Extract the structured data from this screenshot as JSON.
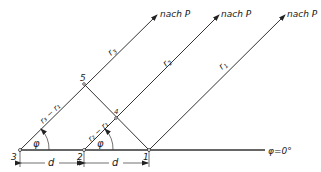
{
  "diagram": {
    "title": "",
    "points": [
      {
        "id": "3",
        "label": "3",
        "x": 20,
        "y": 150
      },
      {
        "id": "2",
        "label": "2",
        "x": 84,
        "y": 150
      },
      {
        "id": "1",
        "label": "1",
        "x": 149,
        "y": 150
      },
      {
        "id": "5",
        "label": "5",
        "x": 84,
        "y": 84
      },
      {
        "id": "4",
        "label": "4",
        "x": 116,
        "y": 118
      }
    ],
    "rays": [
      {
        "from": "3",
        "label": "r3",
        "target_label": "nach P"
      },
      {
        "from": "2",
        "label": "r2",
        "target_label": "nach P"
      },
      {
        "from": "1",
        "label": "r1",
        "target_label": "nach P"
      }
    ],
    "segment_labels": {
      "r3_minus_r1": "r3 − r1",
      "r2_minus_r1": "r2 − r1"
    },
    "angle_label": "φ",
    "baseline_label": "φ = 0°",
    "distance_label": "d",
    "labels": {
      "p1": "1",
      "p2": "2",
      "p3": "3",
      "p4": "4",
      "p5": "5",
      "r1": "r",
      "r1_sub": "1",
      "r2": "r",
      "r2_sub": "2",
      "r3": "r",
      "r3_sub": "3",
      "nach_p": "nach P",
      "phi": "φ",
      "phi_zero": "φ=0°",
      "d": "d",
      "diff31": "r₃ − r₁",
      "diff21": "r₂ − r₁"
    }
  }
}
